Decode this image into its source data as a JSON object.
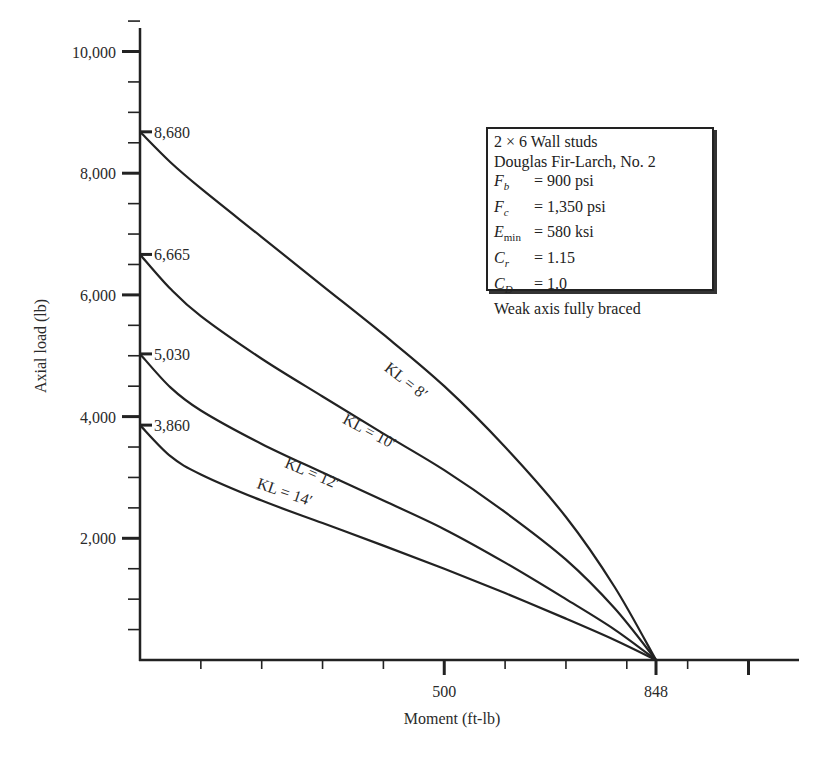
{
  "chart_data": {
    "type": "line",
    "title": "",
    "xlabel": "Moment (ft-lb)",
    "ylabel": "Axial load (lb)",
    "xlim": [
      0,
      1080
    ],
    "ylim": [
      0,
      10500
    ],
    "grid": false,
    "x_ticks": {
      "major": [
        500,
        848,
        1000
      ],
      "major_labels": [
        "500",
        "848"
      ],
      "minor_step": 100
    },
    "y_ticks": {
      "major": [
        2000,
        4000,
        6000,
        8000,
        10000
      ],
      "major_labels": [
        "2,000",
        "4,000",
        "6,000",
        "8,000",
        "10,000"
      ],
      "minor_step": 500
    },
    "series": [
      {
        "name": "KL = 8′",
        "y_intercept_label": "8,680",
        "points": [
          [
            0,
            8680
          ],
          [
            50,
            8180
          ],
          [
            100,
            7750
          ],
          [
            200,
            6950
          ],
          [
            300,
            6150
          ],
          [
            400,
            5350
          ],
          [
            500,
            4500
          ],
          [
            600,
            3500
          ],
          [
            700,
            2350
          ],
          [
            780,
            1200
          ],
          [
            848,
            0
          ]
        ]
      },
      {
        "name": "KL = 10′",
        "y_intercept_label": "6,665",
        "points": [
          [
            0,
            6665
          ],
          [
            50,
            6100
          ],
          [
            100,
            5650
          ],
          [
            200,
            4950
          ],
          [
            300,
            4330
          ],
          [
            400,
            3720
          ],
          [
            500,
            3120
          ],
          [
            600,
            2430
          ],
          [
            700,
            1650
          ],
          [
            780,
            850
          ],
          [
            848,
            0
          ]
        ]
      },
      {
        "name": "KL = 12′",
        "y_intercept_label": "5,030",
        "points": [
          [
            0,
            5030
          ],
          [
            50,
            4480
          ],
          [
            100,
            4100
          ],
          [
            200,
            3550
          ],
          [
            300,
            3080
          ],
          [
            400,
            2620
          ],
          [
            500,
            2150
          ],
          [
            600,
            1600
          ],
          [
            700,
            1000
          ],
          [
            780,
            500
          ],
          [
            848,
            0
          ]
        ]
      },
      {
        "name": "KL = 14′",
        "y_intercept_label": "3,860",
        "points": [
          [
            0,
            3860
          ],
          [
            50,
            3350
          ],
          [
            100,
            3050
          ],
          [
            200,
            2620
          ],
          [
            300,
            2250
          ],
          [
            400,
            1880
          ],
          [
            500,
            1500
          ],
          [
            600,
            1100
          ],
          [
            700,
            680
          ],
          [
            780,
            330
          ],
          [
            848,
            0
          ]
        ]
      }
    ],
    "annotations": [
      {
        "text": "KL = 8′",
        "series": 0
      },
      {
        "text": "KL = 10′",
        "series": 1
      },
      {
        "text": "KL = 12′",
        "series": 2
      },
      {
        "text": "KL = 14′",
        "series": 3
      }
    ],
    "legend_position": "upper-right (info box)"
  },
  "info_box": {
    "title": "2 × 6 Wall studs",
    "species": "Douglas Fir-Larch, No. 2",
    "properties": [
      {
        "symbol": "F",
        "sub": "b",
        "sub_upright": false,
        "value": "= 900 psi"
      },
      {
        "symbol": "F",
        "sub": "c",
        "sub_upright": false,
        "value": "= 1,350 psi"
      },
      {
        "symbol": "E",
        "sub": "min",
        "sub_upright": true,
        "value": "= 580 ksi"
      },
      {
        "symbol": "C",
        "sub": "r",
        "sub_upright": false,
        "value": "= 1.15"
      },
      {
        "symbol": "C",
        "sub": "D",
        "sub_upright": false,
        "value": "= 1.0"
      }
    ],
    "note": "Weak axis fully braced"
  },
  "colors": {
    "line": "#222222",
    "background": "#ffffff",
    "text": "#2a2a2a"
  }
}
